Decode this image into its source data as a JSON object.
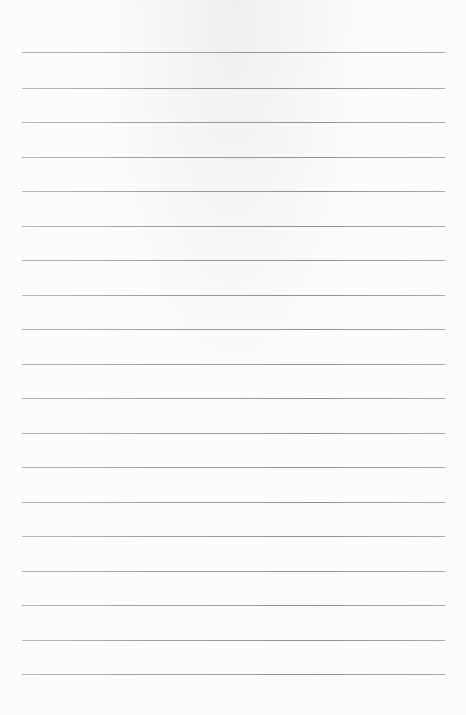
{
  "document": {
    "type": "lined-paper",
    "background_color": "#fcfcfb",
    "line_color": "#8a8a8a",
    "line_count": 19,
    "line_left": 22,
    "line_width": 423,
    "line_positions_y": [
      52,
      88,
      122,
      157,
      191,
      226,
      260,
      295,
      329,
      364,
      398,
      433,
      467,
      502,
      536,
      571,
      605,
      640,
      674
    ]
  }
}
